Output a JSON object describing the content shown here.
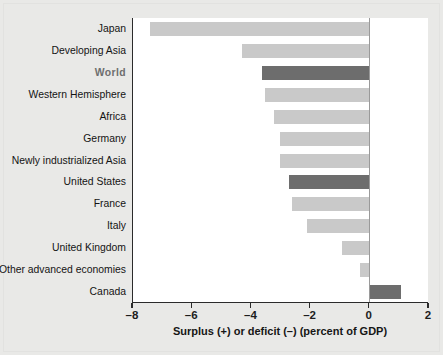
{
  "chart_data": {
    "type": "bar",
    "orientation": "horizontal",
    "title": "",
    "xlabel": "Surplus (+) or deficit (–) (percent of GDP)",
    "ylabel": "",
    "xlim": [
      -8,
      2
    ],
    "xticks": [
      -8,
      -6,
      -4,
      -2,
      0,
      2
    ],
    "xtick_labels": [
      "–8",
      "–6",
      "–4",
      "–2",
      "0",
      "2"
    ],
    "grid": false,
    "legend": null,
    "zero_reference_line": true,
    "categories": [
      "Japan",
      "Developing Asia",
      "World",
      "Western Hemisphere",
      "Africa",
      "Germany",
      "Newly industrialized Asia",
      "United States",
      "France",
      "Italy",
      "United Kingdom",
      "Other advanced economies",
      "Canada"
    ],
    "values": [
      -7.4,
      -4.3,
      -3.6,
      -3.5,
      -3.2,
      -3.0,
      -3.0,
      -2.7,
      -2.6,
      -2.1,
      -0.9,
      -0.3,
      1.1
    ],
    "highlighted": [
      "World",
      "United States",
      "Canada"
    ],
    "colors": {
      "bar_light": "#c9c9c9",
      "bar_dark": "#6d6d6d",
      "axis": "#2b2b2b",
      "zero_line": "#9a9a9a",
      "plot_background": "#ffffff",
      "page_background": "#e9e9e7",
      "label_text": "#141414",
      "highlight_label_text": "#6e6e6e"
    }
  }
}
